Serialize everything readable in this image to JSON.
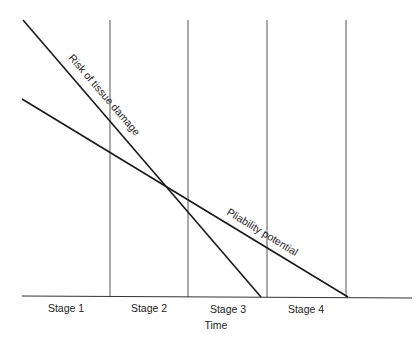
{
  "diagram": {
    "type": "conceptual line diagram",
    "xlabel": "Time",
    "stages": [
      "Stage 1",
      "Stage 2",
      "Stage 3",
      "Stage 4"
    ],
    "lines": [
      {
        "name": "risk",
        "label": "Risk of tissue damage",
        "trend": "decreasing steeply, reaches zero within Stage 3"
      },
      {
        "name": "pliability",
        "label": "Pliability potential",
        "trend": "decreasing gradually, reaches zero at end of Stage 4"
      }
    ],
    "line_color": "#1a1a1a"
  }
}
